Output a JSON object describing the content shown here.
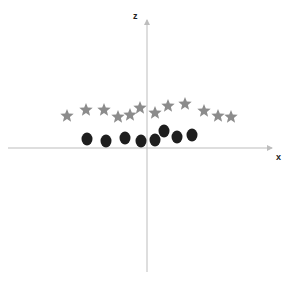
{
  "diagram": {
    "axes": {
      "x_label": "x",
      "z_label": "z",
      "origin": [
        147,
        148
      ],
      "x_range_px": [
        8,
        272
      ],
      "z_range_px": [
        20,
        272
      ],
      "axis_color": "#bdbdbd"
    },
    "stars": {
      "color": "#8c8c8c",
      "points": [
        [
          67,
          116
        ],
        [
          86,
          110
        ],
        [
          104,
          110
        ],
        [
          118,
          117
        ],
        [
          130,
          115
        ],
        [
          140,
          108
        ],
        [
          155,
          113
        ],
        [
          168,
          106
        ],
        [
          185,
          104
        ],
        [
          204,
          111
        ],
        [
          218,
          116
        ],
        [
          231,
          117
        ]
      ]
    },
    "circles": {
      "color": "#1e1e1e",
      "points": [
        [
          87,
          139
        ],
        [
          106,
          141
        ],
        [
          125,
          138
        ],
        [
          141,
          141
        ],
        [
          155,
          140
        ],
        [
          164,
          131
        ],
        [
          177,
          137
        ],
        [
          192,
          135
        ]
      ]
    }
  }
}
